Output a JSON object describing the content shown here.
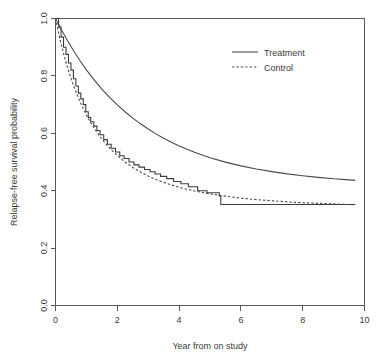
{
  "chart_data": {
    "type": "line",
    "title": "",
    "xlabel": "Year from on study",
    "ylabel": "Relapse-free survival probability",
    "xlim": [
      0,
      10
    ],
    "ylim": [
      0.0,
      1.0
    ],
    "xticks": [
      "0",
      "2",
      "4",
      "6",
      "8",
      "10"
    ],
    "xtick_values": [
      0,
      2,
      4,
      6,
      8,
      10
    ],
    "yticks": [
      "0.0",
      "0.2",
      "0.4",
      "0.6",
      "0.8",
      "1.0"
    ],
    "ytick_values": [
      0.0,
      0.2,
      0.4,
      0.6,
      0.8,
      1.0
    ],
    "grid": false,
    "legend_position": "top-right",
    "series": [
      {
        "name": "Treatment",
        "style": "solid",
        "color": "#4a4a4a",
        "x": [
          0.0,
          0.2,
          0.4,
          0.6,
          0.8,
          1.0,
          1.25,
          1.5,
          1.75,
          2.0,
          2.25,
          2.5,
          2.75,
          3.0,
          3.25,
          3.5,
          3.75,
          4.0,
          4.5,
          5.0,
          5.5,
          6.0,
          6.5,
          7.0,
          7.5,
          8.0,
          8.5,
          9.0,
          9.4,
          9.7
        ],
        "y": [
          1.0,
          0.959,
          0.921,
          0.885,
          0.852,
          0.821,
          0.786,
          0.754,
          0.725,
          0.699,
          0.675,
          0.653,
          0.633,
          0.615,
          0.598,
          0.583,
          0.569,
          0.556,
          0.534,
          0.515,
          0.4995,
          0.4865,
          0.4755,
          0.4665,
          0.4585,
          0.452,
          0.4465,
          0.4415,
          0.4385,
          0.436
        ]
      },
      {
        "name": "Control",
        "style": "dashed",
        "color": "#4a4a4a",
        "x": [
          0.0,
          0.15,
          0.3,
          0.45,
          0.6,
          0.8,
          1.0,
          1.2,
          1.4,
          1.6,
          1.8,
          2.0,
          2.25,
          2.5,
          2.75,
          3.0,
          3.25,
          3.5,
          3.75,
          4.0,
          4.25,
          4.5,
          4.75,
          5.0,
          5.25,
          5.5,
          6.0,
          6.5,
          7.0,
          7.5,
          8.0,
          8.5,
          9.0,
          9.4,
          9.7
        ],
        "y": [
          1.0,
          0.925,
          0.862,
          0.808,
          0.762,
          0.708,
          0.663,
          0.626,
          0.594,
          0.567,
          0.543,
          0.523,
          0.5,
          0.481,
          0.465,
          0.451,
          0.439,
          0.429,
          0.42,
          0.412,
          0.405,
          0.399,
          0.394,
          0.389,
          0.385,
          0.381,
          0.374,
          0.369,
          0.365,
          0.361,
          0.358,
          0.356,
          0.354,
          0.352,
          0.351
        ]
      },
      {
        "name": "Control (Kaplan-Meier steps)",
        "style": "step",
        "color": "#3c3c3c",
        "x": [
          0.0,
          0.1,
          0.18,
          0.26,
          0.34,
          0.42,
          0.5,
          0.58,
          0.66,
          0.74,
          0.82,
          0.9,
          0.98,
          1.06,
          1.14,
          1.24,
          1.34,
          1.44,
          1.56,
          1.68,
          1.8,
          1.94,
          2.08,
          2.22,
          2.38,
          2.54,
          2.7,
          2.88,
          3.06,
          3.22,
          3.4,
          3.6,
          3.82,
          4.06,
          4.3,
          4.6,
          4.9,
          5.3,
          5.35,
          9.7
        ],
        "y": [
          1.0,
          0.97,
          0.935,
          0.9,
          0.875,
          0.845,
          0.82,
          0.79,
          0.765,
          0.74,
          0.72,
          0.7,
          0.675,
          0.655,
          0.64,
          0.625,
          0.61,
          0.595,
          0.578,
          0.562,
          0.548,
          0.535,
          0.522,
          0.512,
          0.5,
          0.49,
          0.482,
          0.474,
          0.466,
          0.458,
          0.45,
          0.442,
          0.432,
          0.424,
          0.414,
          0.4,
          0.393,
          0.382,
          0.352,
          0.352
        ]
      }
    ],
    "legend": [
      {
        "label": "Treatment",
        "style": "solid"
      },
      {
        "label": "Control",
        "style": "dashed"
      }
    ]
  },
  "axes": {
    "x_title": "Year from on study",
    "y_title": "Relapse-free survival probability"
  },
  "colors": {
    "line": "#4a4a4a",
    "axis": "#575757",
    "text": "#3a3a3a",
    "background": "#ffffff"
  }
}
